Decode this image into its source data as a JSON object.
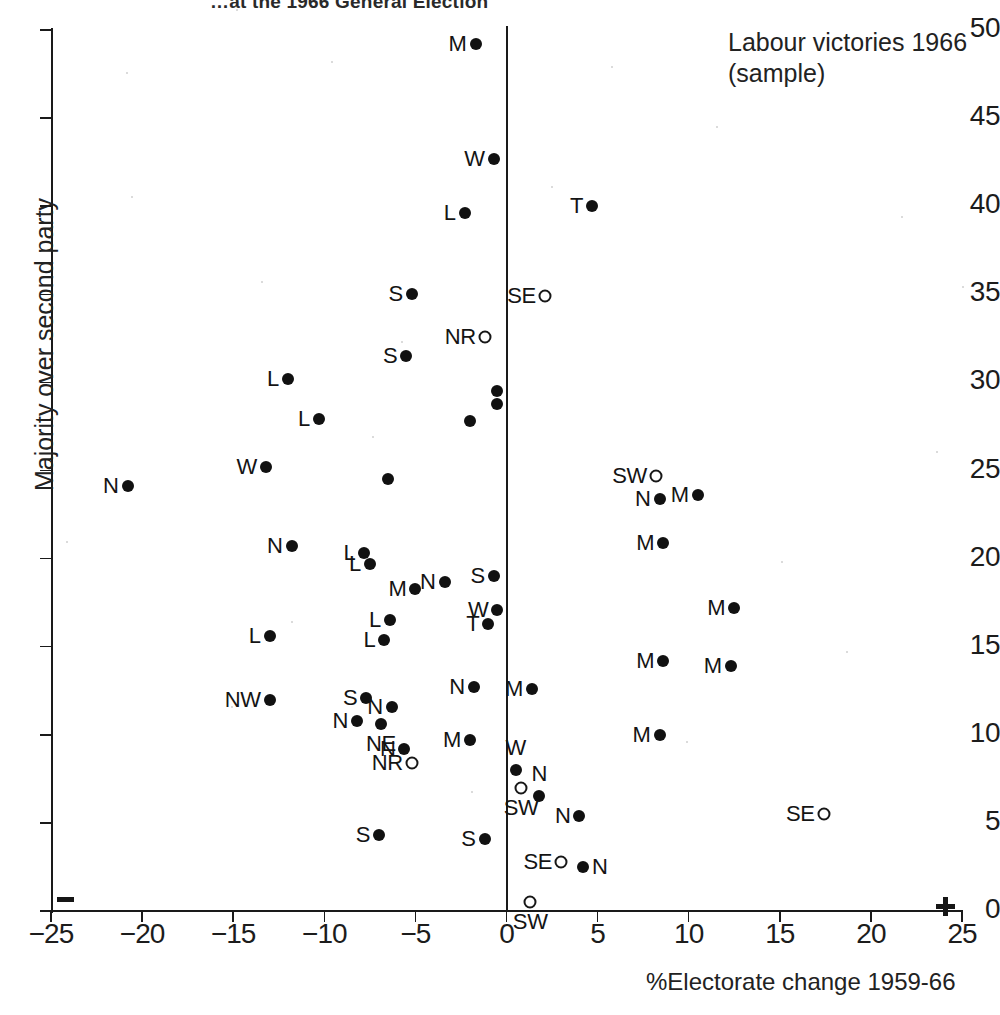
{
  "title": "…at the 1966 General Election",
  "annotation": "Labour victories 1966\n(sample)",
  "axes": {
    "x_title": "%Electorate change 1959-66",
    "y_title": "Majority over second party",
    "x_ticks": [
      "−25",
      "−20",
      "−15",
      "−10",
      "−5",
      "0",
      "5",
      "10",
      "15",
      "20",
      "25"
    ],
    "y_ticks": [
      "0",
      "5",
      "10",
      "15",
      "20",
      "25",
      "30",
      "35",
      "40",
      "45",
      "50"
    ],
    "negative_sign": "−",
    "positive_sign": "+"
  },
  "chart_data": {
    "type": "scatter",
    "title": "…at the 1966 General Election",
    "xlabel": "%Electorate change 1959-66",
    "ylabel": "Majority over second party",
    "xlim": [
      -25,
      25
    ],
    "ylim": [
      0,
      50
    ],
    "xtick_step": 5,
    "ytick_step": 5,
    "grid": false,
    "legend": "Labour victories 1966 (sample)",
    "marker_kinds": {
      "filled": "filled circle",
      "open": "open circle"
    },
    "points": [
      {
        "label": "M",
        "x": -1.7,
        "y": 49.2,
        "marker": "filled",
        "labelpos": "left"
      },
      {
        "label": "W",
        "x": -0.7,
        "y": 42.7,
        "marker": "filled",
        "labelpos": "left"
      },
      {
        "label": "L",
        "x": -2.3,
        "y": 39.6,
        "marker": "filled",
        "labelpos": "left"
      },
      {
        "label": "T",
        "x": 4.7,
        "y": 40.0,
        "marker": "filled",
        "labelpos": "left"
      },
      {
        "label": "S",
        "x": -5.2,
        "y": 35.0,
        "marker": "filled",
        "labelpos": "left"
      },
      {
        "label": "SE",
        "x": 2.1,
        "y": 34.9,
        "marker": "open",
        "labelpos": "left"
      },
      {
        "label": "NR",
        "x": -1.2,
        "y": 32.6,
        "marker": "open",
        "labelpos": "left"
      },
      {
        "label": "S",
        "x": -5.5,
        "y": 31.5,
        "marker": "filled",
        "labelpos": "left"
      },
      {
        "label": "L",
        "x": -12.0,
        "y": 30.2,
        "marker": "filled",
        "labelpos": "left"
      },
      {
        "label": "",
        "x": -0.5,
        "y": 29.5,
        "marker": "filled",
        "labelpos": "none"
      },
      {
        "label": "",
        "x": -0.5,
        "y": 28.8,
        "marker": "filled",
        "labelpos": "none"
      },
      {
        "label": "L",
        "x": -10.3,
        "y": 27.9,
        "marker": "filled",
        "labelpos": "left"
      },
      {
        "label": "",
        "x": -2.0,
        "y": 27.8,
        "marker": "filled",
        "labelpos": "none"
      },
      {
        "label": "W",
        "x": -13.2,
        "y": 25.2,
        "marker": "filled",
        "labelpos": "left"
      },
      {
        "label": "SW",
        "x": 8.2,
        "y": 24.7,
        "marker": "open",
        "labelpos": "left"
      },
      {
        "label": "",
        "x": -6.5,
        "y": 24.5,
        "marker": "filled",
        "labelpos": "none"
      },
      {
        "label": "N",
        "x": -20.8,
        "y": 24.1,
        "marker": "filled",
        "labelpos": "left"
      },
      {
        "label": "M",
        "x": 10.5,
        "y": 23.6,
        "marker": "filled",
        "labelpos": "left"
      },
      {
        "label": "N",
        "x": 8.4,
        "y": 23.4,
        "marker": "filled",
        "labelpos": "left"
      },
      {
        "label": "M",
        "x": 8.6,
        "y": 20.9,
        "marker": "filled",
        "labelpos": "left"
      },
      {
        "label": "N",
        "x": -11.8,
        "y": 20.7,
        "marker": "filled",
        "labelpos": "left"
      },
      {
        "label": "L",
        "x": -7.8,
        "y": 20.3,
        "marker": "filled",
        "labelpos": "left"
      },
      {
        "label": "L",
        "x": -7.5,
        "y": 19.7,
        "marker": "filled",
        "labelpos": "left"
      },
      {
        "label": "S",
        "x": -0.7,
        "y": 19.0,
        "marker": "filled",
        "labelpos": "left"
      },
      {
        "label": "N",
        "x": -3.4,
        "y": 18.7,
        "marker": "filled",
        "labelpos": "left"
      },
      {
        "label": "M",
        "x": -5.0,
        "y": 18.3,
        "marker": "filled",
        "labelpos": "left"
      },
      {
        "label": "M",
        "x": 12.5,
        "y": 17.2,
        "marker": "filled",
        "labelpos": "left"
      },
      {
        "label": "W",
        "x": -0.5,
        "y": 17.1,
        "marker": "filled",
        "labelpos": "left"
      },
      {
        "label": "L",
        "x": -6.4,
        "y": 16.5,
        "marker": "filled",
        "labelpos": "left"
      },
      {
        "label": "T",
        "x": -1.0,
        "y": 16.3,
        "marker": "filled",
        "labelpos": "left"
      },
      {
        "label": "L",
        "x": -13.0,
        "y": 15.6,
        "marker": "filled",
        "labelpos": "left"
      },
      {
        "label": "L",
        "x": -6.7,
        "y": 15.4,
        "marker": "filled",
        "labelpos": "left"
      },
      {
        "label": "M",
        "x": 8.6,
        "y": 14.2,
        "marker": "filled",
        "labelpos": "left"
      },
      {
        "label": "M",
        "x": 12.3,
        "y": 13.9,
        "marker": "filled",
        "labelpos": "left"
      },
      {
        "label": "M",
        "x": 1.4,
        "y": 12.6,
        "marker": "filled",
        "labelpos": "left"
      },
      {
        "label": "N",
        "x": -1.8,
        "y": 12.7,
        "marker": "filled",
        "labelpos": "left"
      },
      {
        "label": "NW",
        "x": -13.0,
        "y": 12.0,
        "marker": "filled",
        "labelpos": "left"
      },
      {
        "label": "S",
        "x": -7.7,
        "y": 12.1,
        "marker": "filled",
        "labelpos": "left"
      },
      {
        "label": "N",
        "x": -6.3,
        "y": 11.6,
        "marker": "filled",
        "labelpos": "left"
      },
      {
        "label": "N",
        "x": -8.2,
        "y": 10.8,
        "marker": "filled",
        "labelpos": "left"
      },
      {
        "label": "NE",
        "x": -6.9,
        "y": 10.6,
        "marker": "filled",
        "labelpos": "below"
      },
      {
        "label": "M",
        "x": 8.4,
        "y": 10.0,
        "marker": "filled",
        "labelpos": "left"
      },
      {
        "label": "M",
        "x": -2.0,
        "y": 9.7,
        "marker": "filled",
        "labelpos": "left"
      },
      {
        "label": "N",
        "x": -5.6,
        "y": 9.2,
        "marker": "filled",
        "labelpos": "left"
      },
      {
        "label": "NR",
        "x": -5.2,
        "y": 8.4,
        "marker": "open",
        "labelpos": "left"
      },
      {
        "label": "W",
        "x": 0.5,
        "y": 8.0,
        "marker": "filled",
        "labelpos": "above"
      },
      {
        "label": "N",
        "x": 1.8,
        "y": 6.5,
        "marker": "filled",
        "labelpos": "above"
      },
      {
        "label": "SW",
        "x": 0.8,
        "y": 7.0,
        "marker": "open",
        "labelpos": "below"
      },
      {
        "label": "N",
        "x": 4.0,
        "y": 5.4,
        "marker": "filled",
        "labelpos": "left"
      },
      {
        "label": "SE",
        "x": 17.4,
        "y": 5.5,
        "marker": "open",
        "labelpos": "left"
      },
      {
        "label": "S",
        "x": -7.0,
        "y": 4.3,
        "marker": "filled",
        "labelpos": "left"
      },
      {
        "label": "S",
        "x": -1.2,
        "y": 4.1,
        "marker": "filled",
        "labelpos": "left"
      },
      {
        "label": "SE",
        "x": 3.0,
        "y": 2.8,
        "marker": "open",
        "labelpos": "left"
      },
      {
        "label": "N",
        "x": 4.2,
        "y": 2.5,
        "marker": "filled",
        "labelpos": "right"
      },
      {
        "label": "SW",
        "x": 1.3,
        "y": 0.5,
        "marker": "open",
        "labelpos": "below"
      }
    ]
  }
}
